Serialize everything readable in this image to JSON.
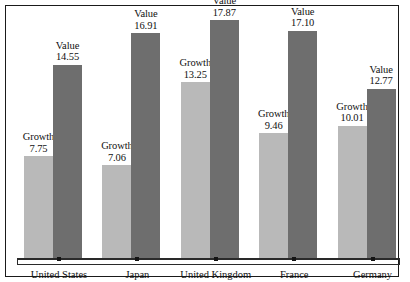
{
  "chart_data": {
    "type": "bar",
    "title": "",
    "subtitle": "",
    "xlabel": "",
    "ylabel": "",
    "grid": false,
    "legend_position": "none",
    "axis_visible": {
      "x": true,
      "y": false
    },
    "ylim": [
      0,
      18.5
    ],
    "categories": [
      "United States",
      "Japan",
      "United Kingdom",
      "France",
      "Germany"
    ],
    "series": [
      {
        "name": "Growth",
        "color": "#b9b9b9",
        "values": [
          7.75,
          7.06,
          13.25,
          9.46,
          10.01
        ],
        "labels": [
          "7.75",
          "7.06",
          "13.25",
          "9.46",
          "10.01"
        ]
      },
      {
        "name": "Value",
        "color": "#6e6e6e",
        "values": [
          14.55,
          16.91,
          17.87,
          17.1,
          12.77
        ],
        "labels": [
          "14.55",
          "16.91",
          "17.87",
          "17.10",
          "12.77"
        ]
      }
    ],
    "annotations": []
  },
  "groups": [
    {
      "category": "United States",
      "growth": {
        "name": "Growth",
        "value": "7.75"
      },
      "value": {
        "name": "Value",
        "value": "14.55"
      }
    },
    {
      "category": "Japan",
      "growth": {
        "name": "Growth",
        "value": "7.06"
      },
      "value": {
        "name": "Value",
        "value": "16.91"
      }
    },
    {
      "category": "United Kingdom",
      "growth": {
        "name": "Growth",
        "value": "13.25"
      },
      "value": {
        "name": "Value",
        "value": "17.87"
      }
    },
    {
      "category": "France",
      "growth": {
        "name": "Growth",
        "value": "9.46"
      },
      "value": {
        "name": "Value",
        "value": "17.10"
      }
    },
    {
      "category": "Germany",
      "growth": {
        "name": "Growth",
        "value": "10.01"
      },
      "value": {
        "name": "Value",
        "value": "12.77"
      }
    }
  ],
  "colors": {
    "growth_bar": "#b9b9b9",
    "value_bar": "#6e6e6e",
    "frame": "#1a1a1a",
    "axis": "#2a2a2a",
    "text": "#111111",
    "background": "#ffffff"
  }
}
